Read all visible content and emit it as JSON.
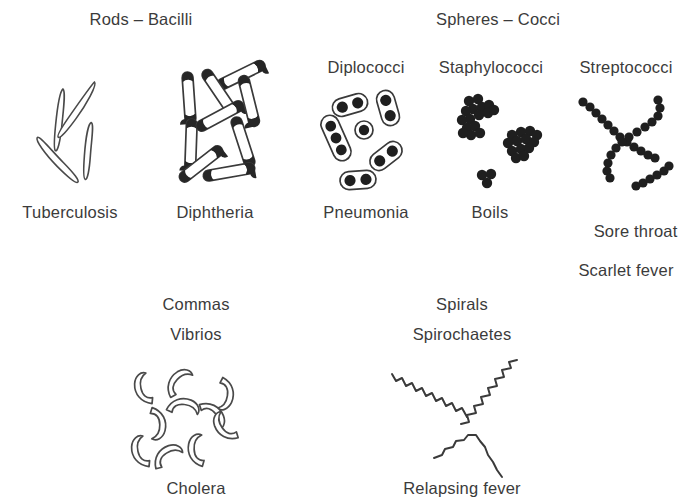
{
  "figure": {
    "title_partial": "",
    "background_color": "#ffffff",
    "ink_color": "#3a3a3a",
    "text_color": "#3b3b3b"
  },
  "groups": [
    {
      "name": "rods",
      "heading": "Rods – Bacilli"
    },
    {
      "name": "spheres",
      "heading": "Spheres – Cocci"
    }
  ],
  "columns": [
    {
      "name": "tuberculosis",
      "group": "rods",
      "sub_heading": "",
      "disease": "Tuberculosis",
      "morphology": "slender outlined rods, scattered at random angles",
      "count": 4
    },
    {
      "name": "diphtheria",
      "group": "rods",
      "sub_heading": "",
      "disease": "Diphtheria",
      "morphology": "rods with dark stained granules at the ends",
      "count": 8
    },
    {
      "name": "diplococci",
      "group": "spheres",
      "sub_heading": "Diplococci",
      "disease": "Pneumonia",
      "morphology": "capsuled pairs of dark cocci",
      "count": 6
    },
    {
      "name": "staphylococci",
      "group": "spheres",
      "sub_heading": "Staphylococci",
      "disease": "Boils",
      "morphology": "grape-like clusters of solid cocci",
      "count": 3
    },
    {
      "name": "streptococci",
      "group": "spheres",
      "sub_heading": "Streptococci",
      "disease_line1": "Sore throat",
      "disease_line2": "Scarlet fever",
      "morphology": "chains of cocci crossing in an X",
      "count": 3
    }
  ],
  "lower": [
    {
      "name": "vibrios",
      "shape_line1": "Commas",
      "shape_line2": "Vibrios",
      "disease": "Cholera",
      "morphology": "comma-shaped outlined curves scattered at random angles",
      "count": 10
    },
    {
      "name": "spirochaetes",
      "shape_line1": "Spirals",
      "shape_line2": "Spirochaetes",
      "disease": "Relapsing fever",
      "morphology": "long wavy corkscrew filaments",
      "count": 3
    }
  ]
}
